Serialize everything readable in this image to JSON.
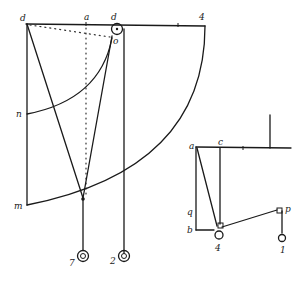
{
  "figure": {
    "ink_color": "#1a1a1a",
    "background": "#ffffff"
  },
  "main_figure": {
    "labels": {
      "top_left": "d",
      "top_mid": "a",
      "top_pulley": "d",
      "top_right": "4",
      "pulley_point": "o",
      "arc_small_end": "n",
      "arc_large_end": "m",
      "weight_left": "7",
      "weight_right": "2"
    }
  },
  "side_figure": {
    "labels": {
      "top_left": "a",
      "top_mid": "c",
      "left_mid": "q",
      "bottom_left": "b",
      "bottom_weight": "4",
      "pulley_right": "p",
      "weight_right": "1"
    }
  }
}
